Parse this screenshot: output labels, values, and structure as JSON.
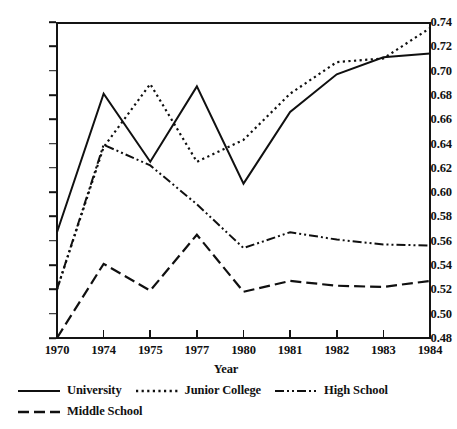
{
  "chart_data": {
    "type": "line",
    "title": "",
    "subtitle": "",
    "xlabel": "Year",
    "ylabel": "",
    "categories": [
      "1970",
      "1974",
      "1975",
      "1977",
      "1980",
      "1981",
      "1982",
      "1983",
      "1984"
    ],
    "x": [
      1970,
      1974,
      1975,
      1977,
      1980,
      1981,
      1982,
      1983,
      1984
    ],
    "ylim": [
      0.48,
      0.74
    ],
    "yticks": [
      0.48,
      0.5,
      0.52,
      0.54,
      0.56,
      0.58,
      0.6,
      0.62,
      0.64,
      0.66,
      0.68,
      0.7,
      0.72,
      0.74
    ],
    "ytick_labels": [
      "0.48",
      "0.50",
      "0.52",
      "0.54",
      "0.56",
      "0.58",
      "0.60",
      "0.62",
      "0.64",
      "0.66",
      "0.68",
      "0.70",
      "0.72",
      "0.74"
    ],
    "grid": false,
    "legend_position": "below",
    "axis_spacing": "categorical-even",
    "series": [
      {
        "name": "University",
        "style": "solid",
        "color": "#101010",
        "values": [
          0.567,
          0.681,
          0.625,
          0.687,
          0.607,
          0.666,
          0.697,
          0.711,
          0.714
        ]
      },
      {
        "name": "Junior College",
        "style": "dotted",
        "color": "#101010",
        "values": [
          0.52,
          0.637,
          0.689,
          0.625,
          0.643,
          0.681,
          0.707,
          0.71,
          0.735
        ]
      },
      {
        "name": "High School",
        "style": "dash-dot-dot",
        "color": "#101010",
        "values": [
          0.52,
          0.639,
          0.622,
          0.59,
          0.554,
          0.567,
          0.561,
          0.557,
          0.556
        ]
      },
      {
        "name": "Middle School",
        "style": "long-dash",
        "color": "#101010",
        "values": [
          0.48,
          0.541,
          0.519,
          0.565,
          0.518,
          0.527,
          0.523,
          0.522,
          0.527
        ]
      }
    ]
  },
  "legend": {
    "items": [
      {
        "label": "University",
        "style": "solid"
      },
      {
        "label": "Junior College",
        "style": "dotted"
      },
      {
        "label": "High School",
        "style": "dash-dot-dot"
      },
      {
        "label": "Middle School",
        "style": "long-dash"
      }
    ]
  }
}
